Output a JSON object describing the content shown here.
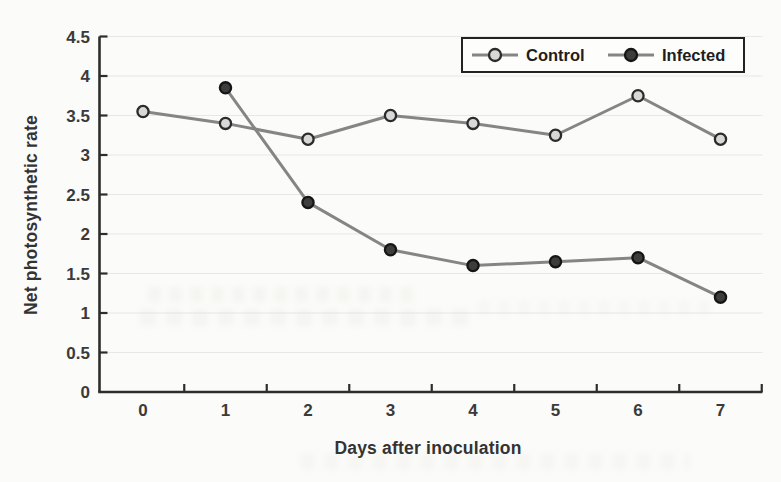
{
  "figure": {
    "background": "#fbfbf9"
  },
  "chart_data": {
    "type": "line",
    "title": "",
    "xlabel": "Days after inoculation",
    "ylabel": "Net photosynthetic rate",
    "xtick_labels": [
      "0",
      "1",
      "2",
      "3",
      "4",
      "5",
      "6",
      "7"
    ],
    "ytick_labels": [
      "0",
      "0.5",
      "1",
      "1.5",
      "2",
      "2.5",
      "3",
      "3.5",
      "4",
      "4.5"
    ],
    "xlim": [
      -0.5,
      7.5
    ],
    "ylim": [
      0,
      4.5
    ],
    "grid": true,
    "legend_position": "top-right",
    "series": [
      {
        "name": "Control",
        "x": [
          0,
          1,
          2,
          3,
          4,
          5,
          6,
          7
        ],
        "values": [
          3.55,
          3.4,
          3.2,
          3.5,
          3.4,
          3.25,
          3.75,
          3.2
        ],
        "marker_fill": "#d8d8d8",
        "marker_stroke": "#2b2b2b",
        "line_color": "#858585"
      },
      {
        "name": "Infected",
        "x": [
          1,
          2,
          3,
          4,
          5,
          6,
          7
        ],
        "values": [
          3.85,
          2.4,
          1.8,
          1.6,
          1.65,
          1.7,
          1.2
        ],
        "marker_fill": "#3d3d3d",
        "marker_stroke": "#151515",
        "line_color": "#858585"
      }
    ],
    "colors": {
      "axis": "#2d2d2d",
      "grid": "#e7e7e3",
      "tick_label": "#3a3a3a",
      "axis_title": "#333333",
      "legend_border": "#222222",
      "legend_bg": "#fdfdfc",
      "legend_text": "#1e1e1e"
    }
  }
}
